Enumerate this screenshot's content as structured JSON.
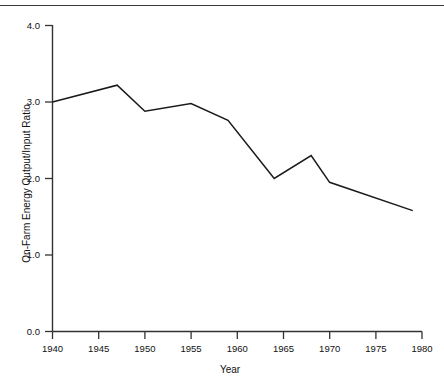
{
  "figure": {
    "background_color": "#ffffff",
    "line_color": "#1a1a1a",
    "axis_color": "#333333",
    "rule_color": "#3a3a3a"
  },
  "chart_data": {
    "type": "line",
    "title": "",
    "subtitle": "",
    "xlabel": "Year",
    "ylabel": "On-Farm Energy Output/Input Ratio",
    "xlim": [
      1938,
      1981
    ],
    "ylim": [
      0.0,
      4.0
    ],
    "grid": false,
    "legend": null,
    "legend_position": "none",
    "xticks": [
      1940,
      1945,
      1950,
      1955,
      1960,
      1965,
      1970,
      1975,
      1980
    ],
    "xtick_labels": [
      "1940",
      "1945",
      "1950",
      "1955",
      "1960",
      "1965",
      "1970",
      "1975",
      "1980"
    ],
    "yticks": [
      0.0,
      1.0,
      2.0,
      3.0,
      4.0
    ],
    "ytick_labels": [
      "0.0",
      "1.0",
      "2.0",
      "3.0",
      "4.0"
    ],
    "series": [
      {
        "name": "On-Farm Energy Output/Input Ratio",
        "x": [
          1940,
          1947,
          1950,
          1955,
          1959,
          1964,
          1968,
          1970,
          1979
        ],
        "values": [
          3.0,
          3.22,
          2.88,
          2.98,
          2.76,
          2.0,
          2.3,
          1.95,
          1.58
        ]
      }
    ],
    "annotations": []
  }
}
